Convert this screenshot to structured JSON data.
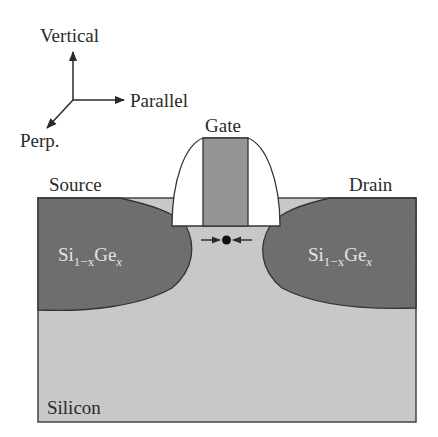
{
  "diagram": {
    "type": "MOSFET cross-section with embedded SiGe source/drain stressors",
    "axes": {
      "vertical_label": "Vertical",
      "parallel_label": "Parallel",
      "perp_label": "Perp."
    },
    "labels": {
      "gate": "Gate",
      "source": "Source",
      "drain": "Drain",
      "substrate": "Silicon",
      "sige_source": {
        "base": "Si",
        "sub1": "1−x",
        "mid": "Ge",
        "sub2": "x"
      },
      "sige_drain": {
        "base": "Si",
        "sub1": "1−x",
        "mid": "Ge",
        "sub2": "x"
      }
    },
    "colors": {
      "silicon": "#c8c8c8",
      "sige": "#6e6e6e",
      "gate": "#959595",
      "spacer": "#ffffff",
      "outline": "#333333",
      "text": "#2a2a2a",
      "text_on_dark": "#e4e4e4"
    },
    "annotation": "Compressive stress arrows pointing inward toward a carrier in the channel"
  }
}
